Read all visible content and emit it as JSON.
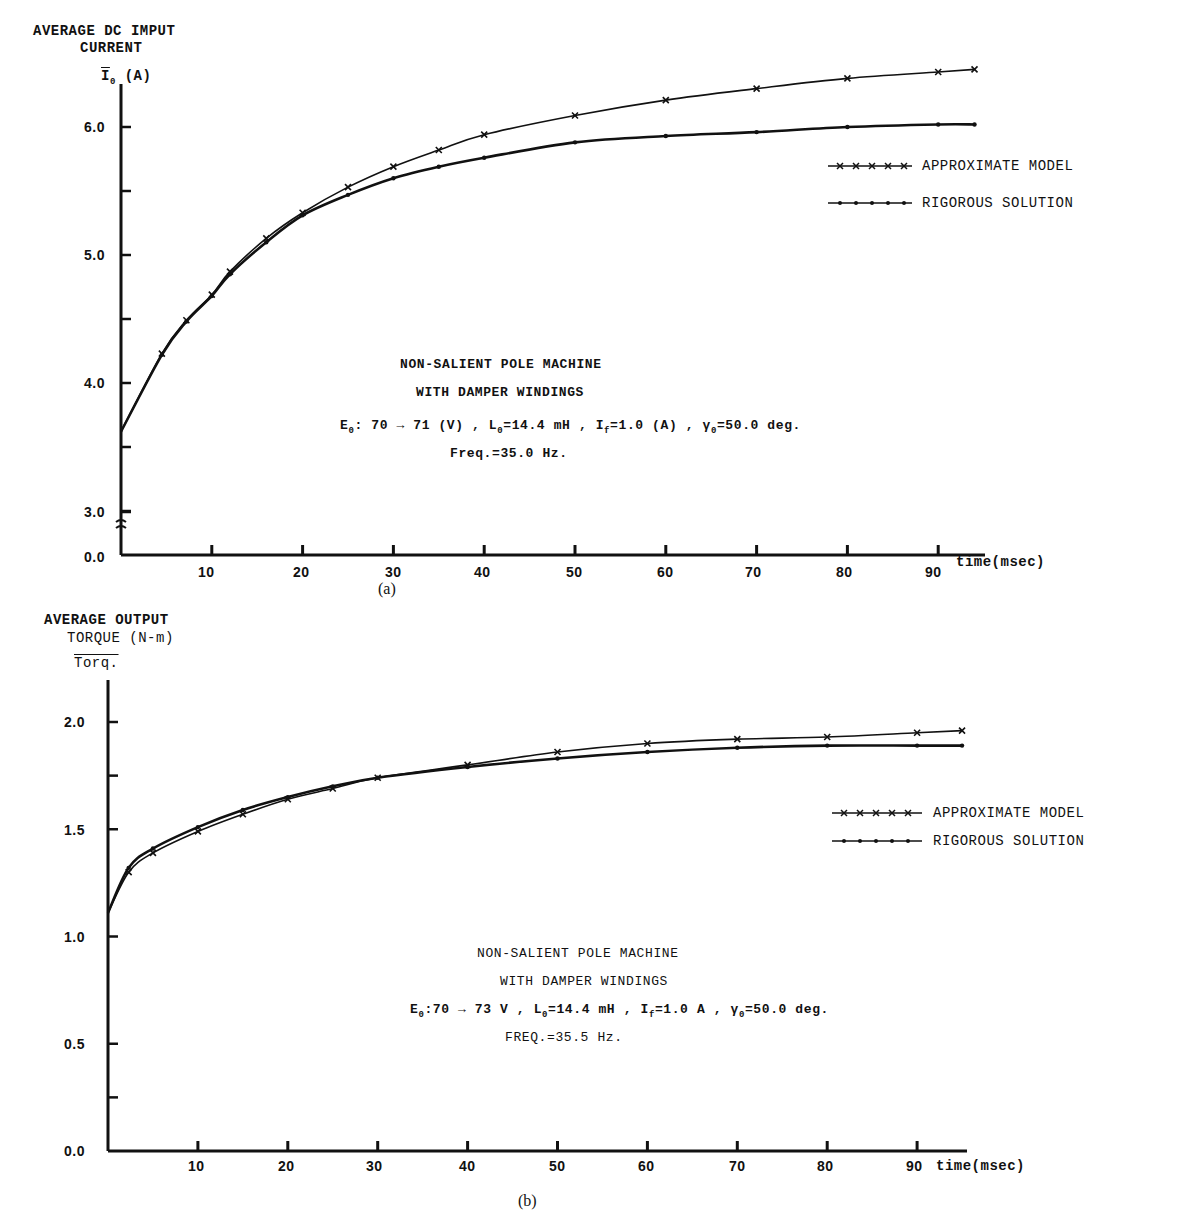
{
  "chart_data": [
    {
      "id": "a",
      "type": "line",
      "caption": "(a)",
      "ylabel_line1": "AVERAGE DC IMPUT",
      "ylabel_line2": "CURRENT",
      "ysymbol": "Ī₀ (A)",
      "xlabel": "time (msec)",
      "xlabel_display": "time(msec)",
      "ylim": [
        3.0,
        6.4
      ],
      "axis_break": "0.0 to 3.0 (broken axis)",
      "y_ticks": [
        "0.0",
        "3.0",
        "4.0",
        "5.0",
        "6.0"
      ],
      "x_ticks": [
        "10",
        "20",
        "30",
        "40",
        "50",
        "60",
        "70",
        "80",
        "90"
      ],
      "xlim": [
        0,
        95
      ],
      "grid": false,
      "legend_position": "upper right",
      "legend": [
        "APPROXIMATE MODEL",
        "RIGOROUS SOLUTION"
      ],
      "annotation": {
        "line1": "NON-SALIENT POLE MACHINE",
        "line2": "WITH DAMPER WINDINGS",
        "line3": "E₀: 70 → 71 (V) , L₀=14.4 mH , I_f=1.0 (A) , γ₀=50.0 deg.",
        "line4": "Freq.=35.0 Hz."
      },
      "x": [
        0,
        4.5,
        7.2,
        10,
        12,
        16,
        20,
        25,
        30,
        35,
        40,
        50,
        60,
        70,
        80,
        90,
        94
      ],
      "series": [
        {
          "name": "APPROXIMATE MODEL",
          "marker": "x",
          "values": [
            3.62,
            4.23,
            4.49,
            4.69,
            4.87,
            5.13,
            5.33,
            5.53,
            5.69,
            5.82,
            5.94,
            6.09,
            6.21,
            6.3,
            6.38,
            6.43,
            6.45
          ]
        },
        {
          "name": "RIGOROUS SOLUTION",
          "marker": "dot",
          "values": [
            3.62,
            4.22,
            4.48,
            4.68,
            4.85,
            5.1,
            5.31,
            5.47,
            5.6,
            5.69,
            5.76,
            5.88,
            5.93,
            5.96,
            6.0,
            6.02,
            6.02
          ]
        }
      ]
    },
    {
      "id": "b",
      "type": "line",
      "caption": "(b)",
      "ylabel_line1": "AVERAGE OUTPUT",
      "ylabel_line2": "TORQUE (N-m)",
      "ysymbol": "T̄orq.",
      "xlabel": "time (msec)",
      "xlabel_display": "time(msec)",
      "ylim": [
        0.0,
        2.1
      ],
      "y_ticks": [
        "0.0",
        "0.5",
        "1.0",
        "1.5",
        "2.0"
      ],
      "x_ticks": [
        "10",
        "20",
        "30",
        "40",
        "50",
        "60",
        "70",
        "80",
        "90"
      ],
      "xlim": [
        0,
        95
      ],
      "grid": false,
      "legend_position": "right",
      "legend": [
        "APPROXIMATE MODEL",
        "RIGOROUS SOLUTION"
      ],
      "annotation": {
        "line1": "NON-SALIENT POLE MACHINE",
        "line2": "WITH DAMPER WINDINGS",
        "line3": "E₀:70 → 73 V , L₀=14.4 mH , I_f=1.0 A , γ₀=50.0 deg.",
        "line4": "FREQ.=35.5 Hz."
      },
      "x": [
        0,
        2.3,
        5,
        10,
        15,
        20,
        25,
        30,
        40,
        50,
        60,
        70,
        80,
        90,
        95
      ],
      "series": [
        {
          "name": "APPROXIMATE MODEL",
          "marker": "x",
          "values": [
            1.11,
            1.3,
            1.39,
            1.49,
            1.57,
            1.64,
            1.69,
            1.74,
            1.8,
            1.86,
            1.9,
            1.92,
            1.93,
            1.95,
            1.96
          ]
        },
        {
          "name": "RIGOROUS SOLUTION",
          "marker": "dot",
          "values": [
            1.11,
            1.32,
            1.41,
            1.51,
            1.59,
            1.65,
            1.7,
            1.74,
            1.79,
            1.83,
            1.86,
            1.88,
            1.89,
            1.89,
            1.89
          ]
        }
      ]
    }
  ],
  "text": {
    "a": {
      "ylabel_line1": "AVERAGE DC IMPUT",
      "ylabel_line2": "CURRENT",
      "ysymbol_main": "I",
      "ysymbol_sub": "0",
      "ysymbol_unit": "(A)",
      "yticks": [
        "6.0",
        "5.0",
        "4.0",
        "3.0",
        "0.0"
      ],
      "xticks": [
        "10",
        "20",
        "30",
        "40",
        "50",
        "60",
        "70",
        "80",
        "90"
      ],
      "xlabel": "time(msec)",
      "legend_approx": "APPROXIMATE MODEL",
      "legend_rigorous": "RIGOROUS SOLUTION",
      "note1": "NON-SALIENT POLE MACHINE",
      "note2": "WITH DAMPER WINDINGS",
      "note3_E": "E",
      "note3_rest1": ": 70 → 71 (V) , L",
      "note3_rest2": "=14.4 mH , I",
      "note3_rest3": "=1.0 (A) , γ",
      "note3_rest4": "=50.0 deg.",
      "note4": "Freq.=35.0 Hz.",
      "caption": "(a)"
    },
    "b": {
      "ylabel_line1": "AVERAGE OUTPUT",
      "ylabel_line2": "TORQUE (N-m)",
      "ysymbol_main": "Torq.",
      "yticks": [
        "2.0",
        "1.5",
        "1.0",
        "0.5",
        "0.0"
      ],
      "xticks": [
        "10",
        "20",
        "30",
        "40",
        "50",
        "60",
        "70",
        "80",
        "90"
      ],
      "xlabel": "time(msec)",
      "legend_approx": "APPROXIMATE MODEL",
      "legend_rigorous": "RIGOROUS SOLUTION",
      "note1": "NON-SALIENT POLE MACHINE",
      "note2": "WITH DAMPER WINDINGS",
      "note3_E": "E",
      "note3_rest1": ":70 → 73 V , L",
      "note3_rest2": "=14.4 mH , I",
      "note3_rest3": "=1.0 A , γ",
      "note3_rest4": "=50.0 deg.",
      "note4": "FREQ.=35.5 Hz.",
      "caption": "(b)"
    },
    "sub0": "0",
    "subf": "f"
  },
  "colors": {
    "ink": "#111111",
    "background": "#ffffff"
  }
}
